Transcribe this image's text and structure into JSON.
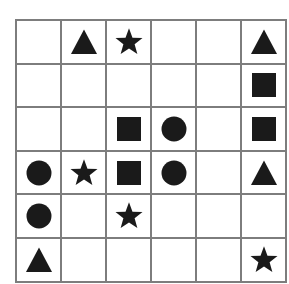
{
  "canvas": {
    "width": 289,
    "height": 284,
    "background": "#ffffff"
  },
  "grid": {
    "name": "shape-grid",
    "rows": 6,
    "columns": 6,
    "line_color": "#7d7d7d",
    "line_width": 2,
    "cell_background": "#ffffff",
    "shape_color": "#1a1a1a",
    "left": 15,
    "top": 19,
    "width": 258,
    "height": 250,
    "cells": [
      [
        {
          "shape": "empty",
          "label": "r1c1"
        },
        {
          "shape": "triangle",
          "label": "r1c2"
        },
        {
          "shape": "star",
          "label": "r1c3"
        },
        {
          "shape": "empty",
          "label": "r1c4"
        },
        {
          "shape": "empty",
          "label": "r1c5"
        },
        {
          "shape": "triangle",
          "label": "r1c6"
        }
      ],
      [
        {
          "shape": "empty",
          "label": "r2c1"
        },
        {
          "shape": "empty",
          "label": "r2c2"
        },
        {
          "shape": "empty",
          "label": "r2c3"
        },
        {
          "shape": "empty",
          "label": "r2c4"
        },
        {
          "shape": "empty",
          "label": "r2c5"
        },
        {
          "shape": "square",
          "label": "r2c6"
        }
      ],
      [
        {
          "shape": "empty",
          "label": "r3c1"
        },
        {
          "shape": "empty",
          "label": "r3c2"
        },
        {
          "shape": "square",
          "label": "r3c3"
        },
        {
          "shape": "circle",
          "label": "r3c4"
        },
        {
          "shape": "empty",
          "label": "r3c5"
        },
        {
          "shape": "square",
          "label": "r3c6"
        }
      ],
      [
        {
          "shape": "circle",
          "label": "r4c1"
        },
        {
          "shape": "star",
          "label": "r4c2"
        },
        {
          "shape": "square",
          "label": "r4c3"
        },
        {
          "shape": "circle",
          "label": "r4c4"
        },
        {
          "shape": "empty",
          "label": "r4c5"
        },
        {
          "shape": "triangle",
          "label": "r4c6"
        }
      ],
      [
        {
          "shape": "circle",
          "label": "r5c1"
        },
        {
          "shape": "empty",
          "label": "r5c2"
        },
        {
          "shape": "star",
          "label": "r5c3"
        },
        {
          "shape": "empty",
          "label": "r5c4"
        },
        {
          "shape": "empty",
          "label": "r5c5"
        },
        {
          "shape": "empty",
          "label": "r5c6"
        }
      ],
      [
        {
          "shape": "triangle",
          "label": "r6c1"
        },
        {
          "shape": "empty",
          "label": "r6c2"
        },
        {
          "shape": "empty",
          "label": "r6c3"
        },
        {
          "shape": "empty",
          "label": "r6c4"
        },
        {
          "shape": "empty",
          "label": "r6c5"
        },
        {
          "shape": "star",
          "label": "r6c6"
        }
      ]
    ],
    "shape_counts": {
      "triangle": 4,
      "star": 4,
      "square": 4,
      "circle": 4,
      "empty": 20
    }
  }
}
